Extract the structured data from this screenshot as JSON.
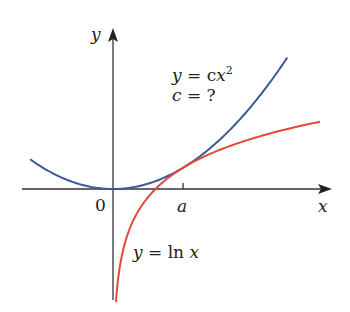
{
  "chart_data": {
    "type": "line",
    "title": "",
    "xlabel": "x",
    "ylabel": "y",
    "origin_label": "0",
    "xlim": [
      -2.15,
      5.1
    ],
    "ylim": [
      -2.62,
      3.78
    ],
    "grid": false,
    "x_ticks": [
      {
        "value": 1.6487,
        "label": "a"
      }
    ],
    "series": [
      {
        "name": "y = cx²",
        "function": "c*x^2",
        "c": 0.18394,
        "domain": [
          -1.95,
          4.1
        ],
        "color": "#3b5998"
      },
      {
        "name": "y = ln x",
        "function": "ln(x)",
        "domain": [
          0.07,
          4.87
        ],
        "color": "#e5483b"
      }
    ],
    "annotations": [
      {
        "lines": [
          "y = cx²",
          "c = ?"
        ]
      },
      {
        "lines": [
          "y = ln x"
        ]
      }
    ]
  },
  "labels": {
    "y_axis": "y",
    "x_axis": "x",
    "origin": "0",
    "tick_a": "a",
    "parabola_y": "y",
    "parabola_eq": " = c",
    "parabola_x": "x",
    "parabola_exp": "2",
    "c_var": "c",
    "c_eq": " = ?",
    "ln_y": "y",
    "ln_eq": " = ln ",
    "ln_x": "x"
  }
}
